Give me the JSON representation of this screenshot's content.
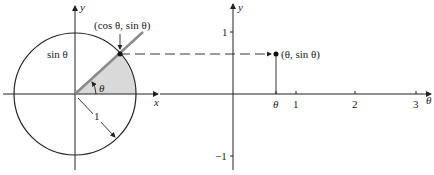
{
  "left_diagram": {
    "title": "unit circle",
    "y_axis_label": "y",
    "x_axis_label": "x",
    "point_label": "(cos θ, sin θ)",
    "sin_label": "sin θ",
    "angle_label": "θ",
    "radius_label": "1",
    "colors": {
      "ray": "#8a8a8a",
      "sector": "#d9d9d9",
      "stroke": "#222222"
    }
  },
  "right_plot": {
    "y_axis_label": "y",
    "x_axis_label": "θ",
    "point_label": "(θ, sin θ)",
    "y_ticks": [
      "1",
      "−1"
    ],
    "x_ticks": [
      "θ",
      "1",
      "2",
      "3"
    ]
  }
}
